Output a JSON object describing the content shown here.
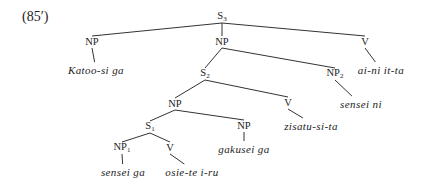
{
  "example_number": "(85′)",
  "nodes": {
    "s3": {
      "label": "S",
      "sub": "3",
      "x": 222,
      "y": 17
    },
    "np_top_left": {
      "label": "NP",
      "sub": "",
      "x": 92,
      "y": 42
    },
    "np_top_center": {
      "label": "NP",
      "sub": "",
      "x": 222,
      "y": 42
    },
    "v_top_right": {
      "label": "V",
      "sub": "",
      "x": 365,
      "y": 42
    },
    "s2": {
      "label": "S",
      "sub": "2",
      "x": 205,
      "y": 74
    },
    "np2": {
      "label": "NP",
      "sub": "2",
      "x": 335,
      "y": 74
    },
    "np_mid": {
      "label": "NP",
      "sub": "",
      "x": 175,
      "y": 104
    },
    "v_mid": {
      "label": "V",
      "sub": "",
      "x": 288,
      "y": 103
    },
    "s1": {
      "label": "S",
      "sub": "1",
      "x": 150,
      "y": 127
    },
    "np_gakusei": {
      "label": "NP",
      "sub": "",
      "x": 244,
      "y": 126
    },
    "np1": {
      "label": "NP",
      "sub": "1",
      "x": 122,
      "y": 148
    },
    "v_osie": {
      "label": "V",
      "sub": "",
      "x": 170,
      "y": 148
    }
  },
  "leaves": {
    "katoo": {
      "text": "Katoo-si ga",
      "x": 96,
      "y": 70
    },
    "ai_ni": {
      "text": "ai-ni it-ta",
      "x": 381,
      "y": 70
    },
    "sensei_ni": {
      "text": "sensei ni",
      "x": 361,
      "y": 104
    },
    "zisatu": {
      "text": "zisatu-si-ta",
      "x": 311,
      "y": 126
    },
    "gakusei": {
      "text": "gakusei ga",
      "x": 244,
      "y": 149
    },
    "sensei_ga": {
      "text": "sensei ga",
      "x": 123,
      "y": 172
    },
    "osie": {
      "text": "osie-te i-ru",
      "x": 192,
      "y": 172
    }
  },
  "edges": [
    [
      "s3",
      "np_top_left"
    ],
    [
      "s3",
      "np_top_center"
    ],
    [
      "s3",
      "v_top_right"
    ],
    [
      "np_top_left",
      "katoo"
    ],
    [
      "v_top_right",
      "ai_ni"
    ],
    [
      "np_top_center",
      "s2"
    ],
    [
      "np_top_center",
      "np2"
    ],
    [
      "np2",
      "sensei_ni"
    ],
    [
      "s2",
      "np_mid"
    ],
    [
      "s2",
      "v_mid"
    ],
    [
      "v_mid",
      "zisatu"
    ],
    [
      "np_mid",
      "s1"
    ],
    [
      "np_mid",
      "np_gakusei"
    ],
    [
      "np_gakusei",
      "gakusei"
    ],
    [
      "s1",
      "np1"
    ],
    [
      "s1",
      "v_osie"
    ],
    [
      "np1",
      "sensei_ga"
    ],
    [
      "v_osie",
      "osie"
    ]
  ],
  "colors": {
    "line": "#333333",
    "text": "#222222",
    "background": "#ffffff"
  }
}
